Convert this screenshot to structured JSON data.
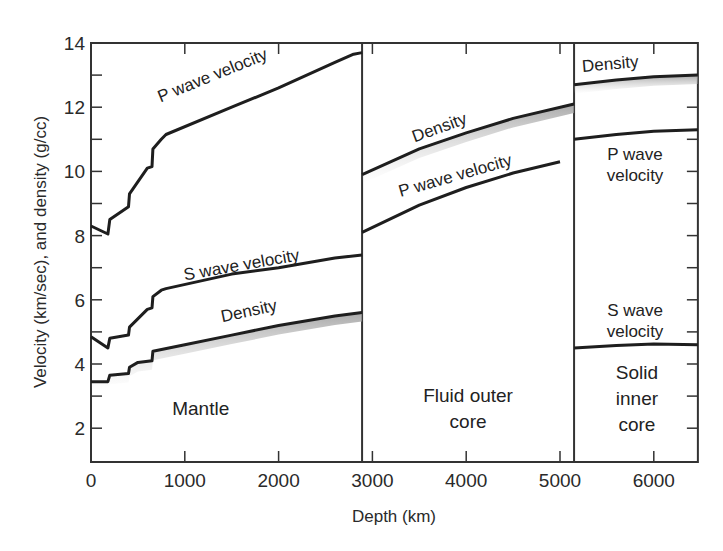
{
  "chart_data": {
    "type": "line",
    "title": "",
    "xlabel": "Depth (km)",
    "ylabel": "Velocity (km/sec), and density (g/cc)",
    "xlim": [
      0,
      6470
    ],
    "ylim": [
      1,
      14
    ],
    "x_ticks": [
      0,
      1000,
      2000,
      3000,
      4000,
      5000,
      6000
    ],
    "y_ticks": [
      2,
      4,
      6,
      8,
      10,
      12,
      14
    ],
    "y_minor_ticks": [
      3,
      5,
      7,
      9,
      11,
      13
    ],
    "grid": false,
    "legend": "none (curves labeled inline)",
    "boundaries": [
      {
        "name": "Mantle / outer core",
        "depth": 2890
      },
      {
        "name": "Outer core / inner core",
        "depth": 5150
      }
    ],
    "regions": [
      {
        "name": "Mantle",
        "lines": [
          "Mantle"
        ],
        "x": 1170,
        "y": 2.6
      },
      {
        "name": "Fluid outer core",
        "lines": [
          "Fluid outer",
          "core"
        ],
        "x": 4020,
        "y": 2.6
      },
      {
        "name": "Solid inner core",
        "lines": [
          "Solid",
          "inner",
          "core"
        ],
        "x": 5820,
        "y": 2.9
      }
    ],
    "series": [
      {
        "name": "P wave velocity (mantle)",
        "label": "P wave velocity",
        "points": [
          [
            0,
            8.3
          ],
          [
            180,
            8.05
          ],
          [
            200,
            8.5
          ],
          [
            400,
            8.9
          ],
          [
            410,
            9.3
          ],
          [
            600,
            10.1
          ],
          [
            650,
            10.15
          ],
          [
            660,
            10.7
          ],
          [
            750,
            11.0
          ],
          [
            800,
            11.15
          ],
          [
            1500,
            12.0
          ],
          [
            2000,
            12.6
          ],
          [
            2600,
            13.4
          ],
          [
            2800,
            13.65
          ],
          [
            2890,
            13.7
          ]
        ]
      },
      {
        "name": "S wave velocity (mantle)",
        "label": "S wave velocity",
        "points": [
          [
            0,
            4.85
          ],
          [
            180,
            4.5
          ],
          [
            200,
            4.8
          ],
          [
            400,
            4.9
          ],
          [
            410,
            5.15
          ],
          [
            600,
            5.7
          ],
          [
            650,
            5.75
          ],
          [
            660,
            6.1
          ],
          [
            750,
            6.3
          ],
          [
            800,
            6.35
          ],
          [
            1500,
            6.8
          ],
          [
            2000,
            7.0
          ],
          [
            2600,
            7.3
          ],
          [
            2890,
            7.4
          ]
        ]
      },
      {
        "name": "Density (mantle)",
        "label": "Density",
        "points": [
          [
            0,
            3.45
          ],
          [
            180,
            3.45
          ],
          [
            200,
            3.65
          ],
          [
            400,
            3.7
          ],
          [
            410,
            3.9
          ],
          [
            500,
            4.05
          ],
          [
            650,
            4.1
          ],
          [
            660,
            4.4
          ],
          [
            1000,
            4.6
          ],
          [
            1500,
            4.9
          ],
          [
            2000,
            5.2
          ],
          [
            2600,
            5.5
          ],
          [
            2890,
            5.6
          ]
        ]
      },
      {
        "name": "Density (outer core)",
        "label": "Density",
        "points": [
          [
            2890,
            9.9
          ],
          [
            3500,
            10.7
          ],
          [
            4000,
            11.2
          ],
          [
            4500,
            11.65
          ],
          [
            5150,
            12.1
          ]
        ]
      },
      {
        "name": "P wave velocity (outer core)",
        "label": "P wave velocity",
        "points": [
          [
            2890,
            8.1
          ],
          [
            3500,
            8.95
          ],
          [
            4000,
            9.5
          ],
          [
            4500,
            9.95
          ],
          [
            5000,
            10.3
          ]
        ]
      },
      {
        "name": "Density (inner core)",
        "label": "Density",
        "points": [
          [
            5150,
            12.7
          ],
          [
            5600,
            12.85
          ],
          [
            6000,
            12.95
          ],
          [
            6470,
            13.0
          ]
        ]
      },
      {
        "name": "P wave velocity (inner core)",
        "label": "P wave velocity",
        "points": [
          [
            5150,
            11.0
          ],
          [
            5600,
            11.15
          ],
          [
            6000,
            11.25
          ],
          [
            6470,
            11.3
          ]
        ]
      },
      {
        "name": "S wave velocity (inner core)",
        "label": "S wave velocity",
        "points": [
          [
            5150,
            4.5
          ],
          [
            5600,
            4.58
          ],
          [
            6000,
            4.62
          ],
          [
            6470,
            4.6
          ]
        ]
      }
    ],
    "annotations": [
      {
        "text": "P wave velocity",
        "x": 740,
        "y": 12.15,
        "angle": -22
      },
      {
        "text": "S wave velocity",
        "x": 1000,
        "y": 6.6,
        "angle": -10
      },
      {
        "text": "Density",
        "x": 1400,
        "y": 5.3,
        "angle": -12
      },
      {
        "text": "Density",
        "x": 3450,
        "y": 10.9,
        "angle": -20
      },
      {
        "text": "P wave velocity",
        "x": 3300,
        "y": 9.2,
        "angle": -16
      },
      {
        "text": "Density",
        "x": 5240,
        "y": 13.1,
        "angle": -5
      },
      {
        "text": "P wave",
        "x": 5800,
        "y": 10.35,
        "angle": 0
      },
      {
        "text": "velocity",
        "x": 5800,
        "y": 9.7,
        "angle": 0
      },
      {
        "text": "S wave",
        "x": 5800,
        "y": 5.5,
        "angle": 0
      },
      {
        "text": "velocity",
        "x": 5800,
        "y": 4.85,
        "angle": 0
      }
    ]
  }
}
